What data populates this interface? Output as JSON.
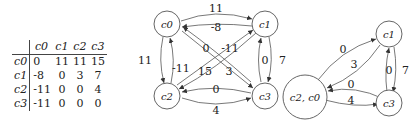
{
  "matrix": {
    "columns": [
      "c0",
      "c1",
      "c2",
      "c3"
    ],
    "rows": [
      {
        "label": "c0",
        "values": [
          "0",
          "11",
          "11",
          "15"
        ]
      },
      {
        "label": "c1",
        "values": [
          "-8",
          "0",
          "3",
          "7"
        ]
      },
      {
        "label": "c2",
        "values": [
          "-11",
          "0",
          "0",
          "4"
        ]
      },
      {
        "label": "c3",
        "values": [
          "-11",
          "0",
          "0",
          "0"
        ]
      }
    ]
  },
  "graph1": {
    "nodes": {
      "c0": "c0",
      "c1": "c1",
      "c2": "c2",
      "c3": "c3"
    },
    "edges": {
      "c0_c1": "11",
      "c1_c0": "-8",
      "c0_c2": "11",
      "c2_c0": "-11",
      "c2_c1": "0",
      "c1_c2": "3",
      "c0_c3": "15",
      "c3_c0": "-11",
      "c1_c3": "7",
      "c3_c1": "0",
      "c2_c3": "4",
      "c3_c2": "0"
    }
  },
  "graph2": {
    "nodes": {
      "merged": "c2, c0",
      "c1": "c1",
      "c3": "c3"
    },
    "edges": {
      "m_c1": "0",
      "c1_m": "3",
      "c3_m": "0",
      "m_c3": "4",
      "c3_c1": "0",
      "c1_c3": "7"
    }
  }
}
